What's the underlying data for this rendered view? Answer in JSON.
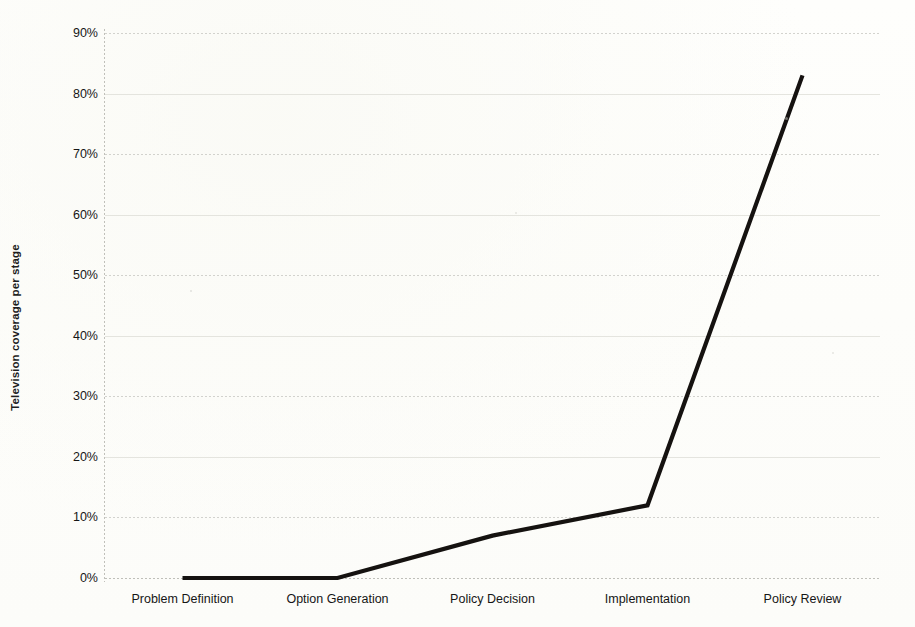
{
  "chart_data": {
    "type": "line",
    "title": "",
    "xlabel": "",
    "ylabel": "Television coverage per stage",
    "categories": [
      "Problem Definition",
      "Option Generation",
      "Policy Decision",
      "Implementation",
      "Policy Review"
    ],
    "values": [
      0,
      0,
      7,
      12,
      83
    ],
    "value_unit": "%",
    "ylim": [
      0,
      90
    ],
    "ytick_labels": [
      "0%",
      "10%",
      "20%",
      "30%",
      "40%",
      "50%",
      "60%",
      "70%",
      "80%",
      "90%"
    ],
    "ytick_values": [
      0,
      10,
      20,
      30,
      40,
      50,
      60,
      70,
      80,
      90
    ],
    "grid": true,
    "grid_style": "dotted-horizontal",
    "legend": false,
    "legend_position": "none",
    "series": [
      {
        "name": "Television coverage per stage",
        "values": [
          0,
          0,
          7,
          12,
          83
        ],
        "color": "#151210"
      }
    ],
    "colors": {
      "line": "#151210",
      "gridline": "#c9c9c4",
      "axis": "#b5b5af",
      "background": "#fdfdfb",
      "text": "#161616"
    }
  }
}
